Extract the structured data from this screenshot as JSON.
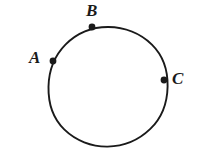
{
  "figure": {
    "background_color": "#ffffff",
    "stroke_color": "#1a1a1a",
    "width": 202,
    "height": 163,
    "circle": {
      "center_x": 108,
      "center_y": 86,
      "radius": 59,
      "stroke_width": 1.9
    },
    "points": [
      {
        "id": "A",
        "label": "A",
        "dot_x": 53,
        "dot_y": 61,
        "dot_radius": 3.4,
        "label_x": 29,
        "label_y": 49,
        "label_position": "left"
      },
      {
        "id": "B",
        "label": "B",
        "dot_x": 92,
        "dot_y": 27,
        "dot_radius": 3.4,
        "label_x": 86,
        "label_y": 2,
        "label_position": "above"
      },
      {
        "id": "C",
        "label": "C",
        "dot_x": 164,
        "dot_y": 80,
        "dot_radius": 3.4,
        "label_x": 172,
        "label_y": 70,
        "label_position": "right"
      }
    ]
  }
}
